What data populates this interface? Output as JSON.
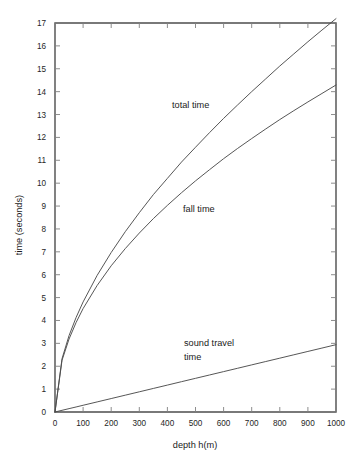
{
  "chart_data": {
    "type": "line",
    "title": "",
    "xlabel": "depth h(m)",
    "ylabel": "time (seconds)",
    "xlim": [
      0,
      1000
    ],
    "ylim": [
      0,
      17
    ],
    "grid": false,
    "legend_position": "inline-annotations",
    "xticks": [
      0,
      100,
      200,
      300,
      400,
      500,
      600,
      700,
      800,
      900,
      1000
    ],
    "xtick_labels": [
      "0",
      "100",
      "200",
      "300",
      "400",
      "500",
      "600",
      "700",
      "800",
      "900",
      "1000"
    ],
    "yticks": [
      0,
      1,
      2,
      3,
      4,
      5,
      6,
      7,
      8,
      9,
      10,
      11,
      12,
      13,
      14,
      15,
      16,
      17
    ],
    "ytick_labels": [
      "0",
      "1",
      "2",
      "3",
      "4",
      "5",
      "6",
      "7",
      "8",
      "9",
      "10",
      "11",
      "12",
      "13",
      "14",
      "15",
      "16",
      "17"
    ],
    "x": [
      0,
      25,
      50,
      75,
      100,
      150,
      200,
      250,
      300,
      350,
      400,
      450,
      500,
      550,
      600,
      650,
      700,
      750,
      800,
      850,
      900,
      950,
      1000
    ],
    "series": [
      {
        "name": "total time",
        "label": "total time",
        "color": "#4d4d4d",
        "values": [
          0,
          2.33,
          3.34,
          4.13,
          4.81,
          5.97,
          6.97,
          7.88,
          8.71,
          9.5,
          10.21,
          10.92,
          11.57,
          12.21,
          12.83,
          13.42,
          14.0,
          14.56,
          15.12,
          15.65,
          16.18,
          16.69,
          17.19
        ]
      },
      {
        "name": "fall time",
        "label": "fall time",
        "color": "#4d4d4d",
        "values": [
          0,
          2.26,
          3.19,
          3.91,
          4.52,
          5.53,
          6.39,
          7.14,
          7.82,
          8.45,
          9.03,
          9.58,
          10.1,
          10.59,
          11.07,
          11.52,
          11.95,
          12.37,
          12.78,
          13.17,
          13.55,
          13.92,
          14.29
        ]
      },
      {
        "name": "sound travel time",
        "label": "sound travel\ntime",
        "color": "#4d4d4d",
        "values": [
          0,
          0.074,
          0.147,
          0.22,
          0.294,
          0.441,
          0.588,
          0.735,
          0.882,
          1.029,
          1.176,
          1.324,
          1.471,
          1.618,
          1.765,
          1.912,
          2.059,
          2.206,
          2.353,
          2.5,
          2.647,
          2.794,
          2.941
        ]
      }
    ],
    "annotations": [
      {
        "name": "total-time-label",
        "text": "total time",
        "x_px": 172,
        "y_px": 108
      },
      {
        "name": "fall-time-label",
        "text": "fall time",
        "x_px": 183,
        "y_px": 212
      },
      {
        "name": "sound-travel-label-line1",
        "text": "sound travel",
        "x_px": 184,
        "y_px": 346
      },
      {
        "name": "sound-travel-label-line2",
        "text": "time",
        "x_px": 184,
        "y_px": 360
      }
    ]
  }
}
